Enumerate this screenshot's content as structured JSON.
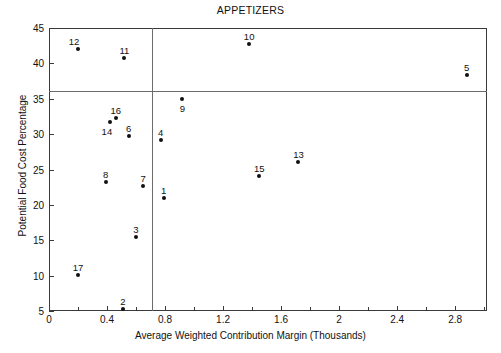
{
  "chart_data": {
    "type": "scatter",
    "title": "APPETIZERS",
    "xlabel": "Average Weighted Contribution Margin (Thousands)",
    "ylabel": "Potential Food Cost Percentage",
    "xlim": [
      0,
      3.02
    ],
    "ylim": [
      5,
      45
    ],
    "grid": false,
    "legend": "none",
    "xticks": [
      0,
      0.4,
      0.8,
      1.2,
      1.6,
      2,
      2.4,
      2.8
    ],
    "xtick_labels": [
      "0",
      "0.4",
      "0.8",
      "1.2",
      "1.6",
      "2",
      "2.4",
      "2.8"
    ],
    "xminor_ticks": [
      0.2,
      0.6,
      1.0,
      1.4,
      1.8,
      2.2,
      2.6,
      3.0
    ],
    "yticks": [
      5,
      10,
      15,
      20,
      25,
      30,
      35,
      40,
      45
    ],
    "ytick_labels": [
      "5",
      "10",
      "15",
      "20",
      "25",
      "30",
      "35",
      "40",
      "45"
    ],
    "reference_lines": {
      "vertical_x": 0.71,
      "horizontal_y": 36.1
    },
    "point_label_position": "above",
    "points": [
      {
        "label": "12",
        "x": 0.2,
        "y": 42.0,
        "label_dx": -4,
        "label_dy": -13
      },
      {
        "label": "11",
        "x": 0.52,
        "y": 40.7,
        "label_dx": 0,
        "label_dy": -13
      },
      {
        "label": "10",
        "x": 1.38,
        "y": 42.8,
        "label_dx": 0,
        "label_dy": -13
      },
      {
        "label": "5",
        "x": 2.88,
        "y": 38.3,
        "label_dx": 0,
        "label_dy": -13
      },
      {
        "label": "9",
        "x": 0.92,
        "y": 34.9,
        "label_dx": 0,
        "label_dy": 4
      },
      {
        "label": "16",
        "x": 0.46,
        "y": 32.3,
        "label_dx": 0,
        "label_dy": -13
      },
      {
        "label": "14",
        "x": 0.42,
        "y": 31.7,
        "label_dx": -3,
        "label_dy": 4
      },
      {
        "label": "6",
        "x": 0.55,
        "y": 29.7,
        "label_dx": 0,
        "label_dy": -13
      },
      {
        "label": "4",
        "x": 0.77,
        "y": 29.2,
        "label_dx": 0,
        "label_dy": -13
      },
      {
        "label": "13",
        "x": 1.72,
        "y": 26.0,
        "label_dx": 0,
        "label_dy": -13
      },
      {
        "label": "15",
        "x": 1.45,
        "y": 24.1,
        "label_dx": 0,
        "label_dy": -13
      },
      {
        "label": "8",
        "x": 0.39,
        "y": 23.2,
        "label_dx": 0,
        "label_dy": -13
      },
      {
        "label": "7",
        "x": 0.65,
        "y": 22.6,
        "label_dx": 0,
        "label_dy": -13
      },
      {
        "label": "1",
        "x": 0.79,
        "y": 21.0,
        "label_dx": 0,
        "label_dy": -13
      },
      {
        "label": "3",
        "x": 0.6,
        "y": 15.4,
        "label_dx": 0,
        "label_dy": -13
      },
      {
        "label": "17",
        "x": 0.2,
        "y": 10.1,
        "label_dx": 0,
        "label_dy": -13
      },
      {
        "label": "2",
        "x": 0.51,
        "y": 5.3,
        "label_dx": 0,
        "label_dy": -13
      }
    ]
  }
}
